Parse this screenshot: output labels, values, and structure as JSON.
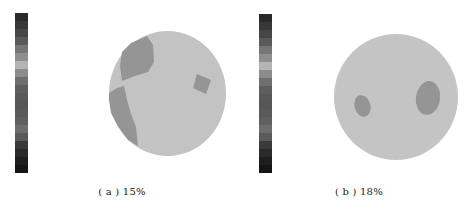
{
  "figure": {
    "panels": [
      {
        "id": "a",
        "caption": "( a ) 15%",
        "colorbar": [
          "#2a2a2a",
          "#383838",
          "#474747",
          "#5a5a5a",
          "#767676",
          "#8f8f8f",
          "#b4b4b4",
          "#8c8c8c",
          "#6f6f6f",
          "#5e5e5e",
          "#585858",
          "#565656",
          "#5a5a5a",
          "#606060",
          "#6e6e6e",
          "#5a5a5a",
          "#3a3a3a",
          "#2a2a2a",
          "#1e1e1e",
          "#151515"
        ],
        "background_color": "#c3c3c3",
        "inclusion_color": "#959595"
      },
      {
        "id": "b",
        "caption": "( b ) 18%",
        "colorbar": [
          "#2a2a2a",
          "#383838",
          "#474747",
          "#5a5a5a",
          "#767676",
          "#8f8f8f",
          "#b4b4b4",
          "#8c8c8c",
          "#6f6f6f",
          "#5e5e5e",
          "#585858",
          "#565656",
          "#5a5a5a",
          "#606060",
          "#6e6e6e",
          "#5a5a5a",
          "#3a3a3a",
          "#2a2a2a",
          "#1e1e1e",
          "#151515"
        ],
        "background_color": "#c4c4c4",
        "inclusion_color": "#959595"
      }
    ]
  }
}
